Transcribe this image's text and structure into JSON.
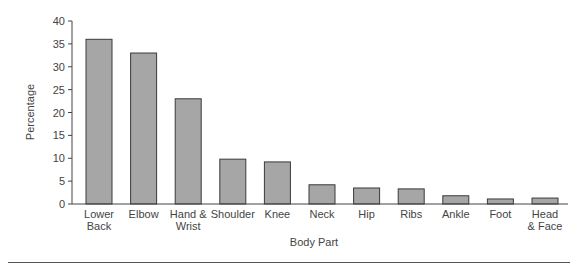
{
  "chart_data": {
    "type": "bar",
    "title": "",
    "xlabel": "Body Part",
    "ylabel": "Percentage",
    "ylim": [
      0,
      40
    ],
    "yticks": [
      0,
      5,
      10,
      15,
      20,
      25,
      30,
      35,
      40
    ],
    "grid": false,
    "legend": null,
    "categories": [
      "Lower Back",
      "Elbow",
      "Hand & Wrist",
      "Shoulder",
      "Knee",
      "Neck",
      "Hip",
      "Ribs",
      "Ankle",
      "Foot",
      "Head & Face"
    ],
    "category_lines": [
      [
        "Lower",
        "Back"
      ],
      [
        "Elbow"
      ],
      [
        "Hand &",
        "Wrist"
      ],
      [
        "Shoulder"
      ],
      [
        "Knee"
      ],
      [
        "Neck"
      ],
      [
        "Hip"
      ],
      [
        "Ribs"
      ],
      [
        "Ankle"
      ],
      [
        "Foot"
      ],
      [
        "Head",
        "& Face"
      ]
    ],
    "values": [
      36,
      33,
      23,
      9.8,
      9.2,
      4.2,
      3.5,
      3.3,
      1.8,
      1.1,
      1.3
    ],
    "colors": {
      "bar_fill": "#a6a6a6",
      "bar_stroke": "#3a3a3a"
    }
  }
}
